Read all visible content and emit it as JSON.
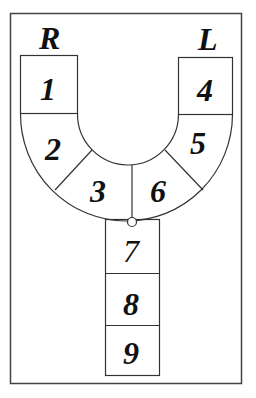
{
  "diagram": {
    "side_labels": {
      "right": "R",
      "left": "L"
    },
    "segments": [
      {
        "id": "1",
        "label": "1"
      },
      {
        "id": "2",
        "label": "2"
      },
      {
        "id": "3",
        "label": "3"
      },
      {
        "id": "4",
        "label": "4"
      },
      {
        "id": "5",
        "label": "5"
      },
      {
        "id": "6",
        "label": "6"
      },
      {
        "id": "7",
        "label": "7"
      },
      {
        "id": "8",
        "label": "8"
      },
      {
        "id": "9",
        "label": "9"
      }
    ],
    "colors": {
      "stroke": "#333333",
      "background": "#ffffff",
      "text": "#111111"
    }
  }
}
